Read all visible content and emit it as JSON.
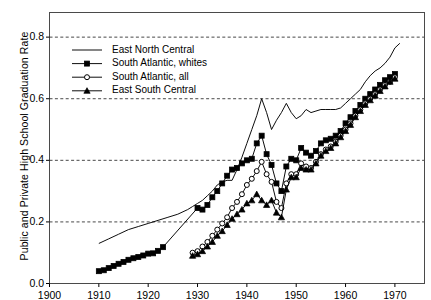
{
  "chart_data": {
    "type": "line",
    "title": "",
    "xlabel": "",
    "ylabel": "Public and Private High School Graduation Rate",
    "xlim": [
      1900,
      1976
    ],
    "ylim": [
      0.0,
      0.88
    ],
    "xticks": [
      1900,
      1910,
      1920,
      1930,
      1940,
      1950,
      1960,
      1970
    ],
    "xticklabels": [
      "1900",
      "1910",
      "1920",
      "1930",
      "1940",
      "1950",
      "1960",
      "1970"
    ],
    "yticks": [
      0.0,
      0.2,
      0.4,
      0.6,
      0.8
    ],
    "yticklabels": [
      "0.0",
      "0.2",
      "0.4",
      "0.6",
      "0.8"
    ],
    "grid": "horizontal-dashed",
    "gridlines_at": [
      0.2,
      0.4,
      0.6,
      0.8
    ],
    "legend_position": "upper-left",
    "line_color": "#000000",
    "background_color": "#ffffff",
    "series": [
      {
        "name": "East North Central",
        "marker": "none",
        "x": [
          1910,
          1912,
          1914,
          1916,
          1918,
          1920,
          1922,
          1924,
          1926,
          1928,
          1929,
          1930,
          1931,
          1932,
          1933,
          1934,
          1935,
          1936,
          1937,
          1938,
          1939,
          1940,
          1941,
          1942,
          1943,
          1944,
          1945,
          1946,
          1947,
          1948,
          1949,
          1950,
          1951,
          1952,
          1953,
          1954,
          1955,
          1956,
          1957,
          1958,
          1959,
          1960,
          1961,
          1962,
          1963,
          1964,
          1965,
          1966,
          1967,
          1968,
          1969,
          1970,
          1971
        ],
        "y": [
          0.13,
          0.145,
          0.16,
          0.175,
          0.185,
          0.195,
          0.205,
          0.215,
          0.225,
          0.24,
          0.25,
          0.26,
          0.27,
          0.285,
          0.3,
          0.32,
          0.33,
          0.335,
          0.335,
          0.37,
          0.41,
          0.455,
          0.5,
          0.545,
          0.6,
          0.555,
          0.5,
          0.53,
          0.555,
          0.585,
          0.555,
          0.535,
          0.545,
          0.565,
          0.555,
          0.56,
          0.565,
          0.565,
          0.565,
          0.565,
          0.57,
          0.585,
          0.6,
          0.615,
          0.63,
          0.655,
          0.675,
          0.69,
          0.7,
          0.715,
          0.735,
          0.765,
          0.78
        ]
      },
      {
        "name": "South Atlantic, whites",
        "marker": "filled-square",
        "x": [
          1910,
          1911,
          1912,
          1913,
          1914,
          1915,
          1916,
          1917,
          1918,
          1919,
          1920,
          1921,
          1922,
          1923,
          1930,
          1931,
          1932,
          1933,
          1934,
          1935,
          1936,
          1937,
          1938,
          1939,
          1940,
          1941,
          1942,
          1943,
          1944,
          1945,
          1946,
          1947,
          1948,
          1949,
          1950,
          1951,
          1952,
          1953,
          1954,
          1955,
          1956,
          1957,
          1958,
          1959,
          1960,
          1961,
          1962,
          1963,
          1964,
          1965,
          1966,
          1967,
          1968,
          1969,
          1970
        ],
        "y": [
          0.04,
          0.043,
          0.05,
          0.057,
          0.064,
          0.07,
          0.077,
          0.082,
          0.086,
          0.091,
          0.097,
          0.098,
          0.106,
          0.118,
          0.245,
          0.24,
          0.255,
          0.28,
          0.3,
          0.325,
          0.35,
          0.37,
          0.375,
          0.39,
          0.4,
          0.405,
          0.455,
          0.48,
          0.42,
          0.385,
          0.325,
          0.3,
          0.38,
          0.405,
          0.4,
          0.44,
          0.425,
          0.415,
          0.43,
          0.455,
          0.465,
          0.47,
          0.48,
          0.495,
          0.52,
          0.54,
          0.56,
          0.58,
          0.6,
          0.615,
          0.63,
          0.645,
          0.66,
          0.67,
          0.68
        ]
      },
      {
        "name": "South Atlantic, all",
        "marker": "open-circle",
        "x": [
          1929,
          1930,
          1931,
          1932,
          1933,
          1934,
          1935,
          1936,
          1937,
          1938,
          1939,
          1940,
          1941,
          1942,
          1943,
          1944,
          1945,
          1946,
          1947,
          1948,
          1949,
          1950,
          1951,
          1952,
          1953,
          1954,
          1955,
          1956,
          1957,
          1958,
          1959,
          1960,
          1961,
          1962,
          1963,
          1964,
          1965,
          1966,
          1967,
          1968,
          1969,
          1970
        ],
        "y": [
          0.1,
          0.105,
          0.12,
          0.135,
          0.155,
          0.175,
          0.195,
          0.215,
          0.245,
          0.265,
          0.29,
          0.32,
          0.34,
          0.365,
          0.395,
          0.355,
          0.33,
          0.265,
          0.245,
          0.325,
          0.355,
          0.355,
          0.39,
          0.38,
          0.375,
          0.395,
          0.42,
          0.435,
          0.445,
          0.46,
          0.48,
          0.5,
          0.52,
          0.545,
          0.565,
          0.585,
          0.6,
          0.615,
          0.63,
          0.645,
          0.655,
          0.67
        ]
      },
      {
        "name": "East South Central",
        "marker": "filled-triangle",
        "x": [
          1929,
          1930,
          1931,
          1932,
          1933,
          1934,
          1935,
          1936,
          1937,
          1938,
          1939,
          1940,
          1941,
          1942,
          1943,
          1944,
          1945,
          1946,
          1947,
          1948,
          1949,
          1950,
          1951,
          1952,
          1953,
          1954,
          1955,
          1956,
          1957,
          1958,
          1959,
          1960,
          1961,
          1962,
          1963,
          1964,
          1965,
          1966,
          1967,
          1968,
          1969,
          1970
        ],
        "y": [
          0.09,
          0.095,
          0.105,
          0.12,
          0.135,
          0.155,
          0.17,
          0.19,
          0.21,
          0.225,
          0.24,
          0.26,
          0.27,
          0.29,
          0.27,
          0.255,
          0.27,
          0.23,
          0.215,
          0.305,
          0.345,
          0.345,
          0.375,
          0.37,
          0.37,
          0.39,
          0.415,
          0.43,
          0.44,
          0.455,
          0.475,
          0.495,
          0.515,
          0.54,
          0.56,
          0.58,
          0.595,
          0.61,
          0.625,
          0.64,
          0.655,
          0.665
        ]
      }
    ]
  },
  "legend": {
    "entries": [
      {
        "label": "East North Central"
      },
      {
        "label": "South Atlantic, whites"
      },
      {
        "label": "South Atlantic, all"
      },
      {
        "label": "East South Central"
      }
    ]
  }
}
